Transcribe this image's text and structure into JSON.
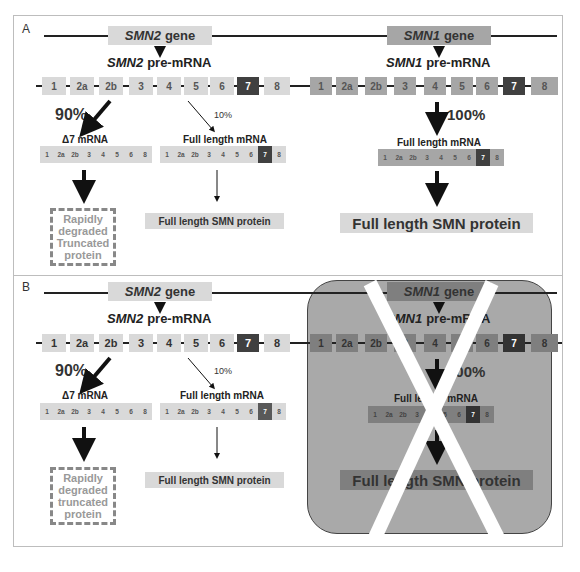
{
  "panels": {
    "A": {
      "label": "A",
      "smn2": {
        "gene_label_italic": "SMN2",
        "gene_label_suffix": "gene",
        "premrna_italic": "SMN2",
        "premrna_suffix": "pre-mRNA",
        "exons": [
          "1",
          "2a",
          "2b",
          "3",
          "4",
          "5",
          "6",
          "7",
          "8"
        ],
        "left_percent": "90%",
        "right_percent": "10%",
        "delta7_label": "Δ7 mRNA",
        "delta7_exons": [
          "1",
          "2a",
          "2b",
          "3",
          "4",
          "5",
          "6",
          "8"
        ],
        "fl_label": "Full length mRNA",
        "fl_exons": [
          "1",
          "2a",
          "2b",
          "3",
          "4",
          "5",
          "6",
          "7",
          "8"
        ],
        "truncated_lines": [
          "Rapidly",
          "degraded",
          "Truncated",
          "protein"
        ],
        "fl_protein": "Full length SMN protein"
      },
      "smn1": {
        "gene_label_italic": "SMN1",
        "gene_label_suffix": "gene",
        "premrna_italic": "SMN1",
        "premrna_suffix": "pre-mRNA",
        "exons": [
          "1",
          "2a",
          "2b",
          "3",
          "4",
          "5",
          "6",
          "7",
          "8"
        ],
        "percent": "100%",
        "fl_label": "Full length mRNA",
        "fl_exons": [
          "1",
          "2a",
          "2b",
          "3",
          "4",
          "5",
          "6",
          "7",
          "8"
        ],
        "fl_protein": "Full length SMN protein"
      }
    },
    "B": {
      "label": "B",
      "smn2": {
        "gene_label_italic": "SMN2",
        "gene_label_suffix": "gene",
        "premrna_italic": "SMN2",
        "premrna_suffix": "pre-mRNA",
        "exons": [
          "1",
          "2a",
          "2b",
          "3",
          "4",
          "5",
          "6",
          "7",
          "8"
        ],
        "left_percent": "90%",
        "right_percent": "10%",
        "delta7_label": "Δ7 mRNA",
        "delta7_exons": [
          "1",
          "2a",
          "2b",
          "3",
          "4",
          "5",
          "6",
          "8"
        ],
        "fl_label": "Full length mRNA",
        "fl_exons": [
          "1",
          "2a",
          "2b",
          "3",
          "4",
          "5",
          "6",
          "7",
          "8"
        ],
        "truncated_lines": [
          "Rapidly",
          "degraded",
          "truncated",
          "protein"
        ],
        "fl_protein": "Full length SMN protein"
      },
      "smn1_deleted": {
        "gene_label_italic": "SMN1",
        "gene_label_suffix": "gene",
        "premrna_italic": "SMN1",
        "premrna_suffix": "pre-mRNA",
        "exons": [
          "1",
          "2a",
          "2b",
          "3",
          "4",
          "5",
          "6",
          "7",
          "8"
        ],
        "percent": "100%",
        "fl_label": "Full length mRNA",
        "fl_exons": [
          "1",
          "2a",
          "2b",
          "3",
          "4",
          "5",
          "6",
          "7",
          "8"
        ],
        "fl_protein": "Full length SMN protein",
        "crossed_out": true
      }
    }
  },
  "colors": {
    "smn2_light": "#d9d9d9",
    "smn1_mid": "#a6a6a6",
    "exon7_dark": "#404040",
    "knockout_bg": "#a9a9a9",
    "knockout_smn1": "#7f7f7f",
    "cross": "#ffffff"
  }
}
